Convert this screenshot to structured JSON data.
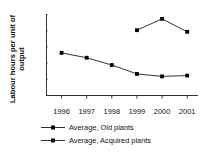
{
  "chart_data": {
    "type": "line",
    "title": "",
    "xlabel": "",
    "ylabel": "Labour hours per unit of output",
    "ylabel_line1": "Labour hours per unit of",
    "ylabel_line2": "output",
    "categories": [
      "1996",
      "1997",
      "1998",
      "1999",
      "2000",
      "2001"
    ],
    "xlim": [
      1995.6,
      2001.4
    ],
    "ylim": [
      0,
      5
    ],
    "y_tick_count": 6,
    "y_tick_labels": [
      "",
      "",
      "",
      "",
      "",
      ""
    ],
    "y_axis_labeled": false,
    "grid": false,
    "legend_position": "bottom",
    "marker": "square",
    "line_color": "#333333",
    "marker_color": "#000000",
    "series": [
      {
        "name": "Average, Old plants",
        "x": [
          "1996",
          "1997",
          "1998",
          "1999",
          "2000",
          "2001"
        ],
        "values": [
          2.6,
          2.3,
          1.85,
          1.3,
          1.15,
          1.2
        ]
      },
      {
        "name": "Average, Acquired plants",
        "x": [
          "1999",
          "2000",
          "2001"
        ],
        "values": [
          4.0,
          4.7,
          3.9
        ]
      }
    ]
  },
  "legend": {
    "entries": [
      {
        "label": "Average, Old plants"
      },
      {
        "label": "Average, Acquired plants"
      }
    ]
  },
  "axis": {
    "x_tick_labels": [
      "1996",
      "1997",
      "1998",
      "1999",
      "2000",
      "2001"
    ]
  }
}
